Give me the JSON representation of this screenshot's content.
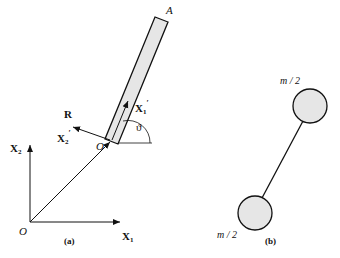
{
  "panel_a": {
    "caption": "(a)",
    "rod_end_label": "A",
    "origin_label": "O",
    "body_origin_label": "O",
    "axis_x1": "X",
    "axis_x1_sub": "1",
    "axis_x2": "X",
    "axis_x2_sub": "2",
    "body_axis_x1": "X",
    "body_axis_x1_sub": "1",
    "body_axis_x2": "X",
    "body_axis_x2_sub": "2",
    "prime": "′",
    "position_vector": "R",
    "angle": "ϑ"
  },
  "panel_b": {
    "caption": "(b)",
    "top_mass": "m / 2",
    "bottom_mass": "m / 2"
  },
  "colors": {
    "fill": "#e6e6e6",
    "stroke": "#111111"
  }
}
